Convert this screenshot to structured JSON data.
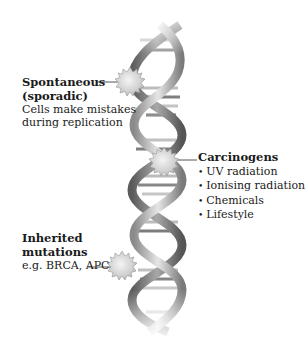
{
  "diagram": {
    "type": "dna-mutation-causes",
    "central_figure": "dna-double-helix",
    "colors": {
      "strand_light": "#d6d6d6",
      "strand_dark": "#6e6e6e",
      "base_light": "#c9c9c9",
      "base_dark": "#7a7a7a",
      "burst": "#d9d9d9",
      "leader_line": "#555555",
      "text": "#1a1a1a"
    },
    "labels": [
      {
        "id": "spontaneous",
        "title": "Spontaneous (sporadic)",
        "title_lines": [
          "Spontaneous",
          "(sporadic)"
        ],
        "description_lines": [
          "Cells make mistakes",
          "during replication"
        ]
      },
      {
        "id": "carcinogens",
        "title": "Carcinogens",
        "items": [
          "UV radiation",
          "Ionising radiation",
          "Chemicals",
          "Lifestyle"
        ]
      },
      {
        "id": "inherited",
        "title": "Inherited mutations",
        "title_lines": [
          "Inherited",
          "mutations"
        ],
        "description_lines": [
          "e.g. BRCA, APC"
        ]
      }
    ],
    "mutation_markers": [
      {
        "id": "spontaneous",
        "icon": "mutation-burst-icon"
      },
      {
        "id": "carcinogens",
        "icon": "mutation-burst-icon"
      },
      {
        "id": "inherited",
        "icon": "mutation-burst-icon"
      }
    ]
  }
}
